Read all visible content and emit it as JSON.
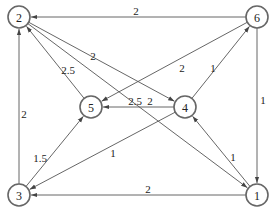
{
  "diagram": {
    "type": "directed-weighted-graph",
    "nodes": [
      {
        "id": "1",
        "label": "1",
        "x": 257,
        "y": 195
      },
      {
        "id": "2",
        "label": "2",
        "x": 19,
        "y": 17
      },
      {
        "id": "3",
        "label": "3",
        "x": 19,
        "y": 195
      },
      {
        "id": "4",
        "label": "4",
        "x": 185,
        "y": 107
      },
      {
        "id": "5",
        "label": "5",
        "x": 91,
        "y": 107
      },
      {
        "id": "6",
        "label": "6",
        "x": 257,
        "y": 17
      }
    ],
    "edges": [
      {
        "from": "6",
        "to": "2",
        "weight": "2",
        "lx": 136,
        "ly": 11
      },
      {
        "from": "6",
        "to": "1",
        "weight": "1",
        "lx": 263,
        "ly": 100
      },
      {
        "from": "1",
        "to": "3",
        "weight": "2",
        "lx": 148,
        "ly": 189
      },
      {
        "from": "3",
        "to": "2",
        "weight": "2",
        "lx": 24,
        "ly": 114
      },
      {
        "from": "3",
        "to": "5",
        "weight": "1.5",
        "lx": 40,
        "ly": 158
      },
      {
        "from": "5",
        "to": "2",
        "weight": "2.5",
        "lx": 68,
        "ly": 70
      },
      {
        "from": "2",
        "to": "4",
        "weight": "2",
        "lx": 93,
        "ly": 56
      },
      {
        "from": "2",
        "to": "1",
        "weight": "2.5",
        "lx": 135,
        "ly": 101
      },
      {
        "from": "4",
        "to": "5",
        "weight": "2",
        "lx": 150,
        "ly": 101
      },
      {
        "from": "6",
        "to": "5",
        "weight": "2",
        "lx": 182,
        "ly": 68
      },
      {
        "from": "4",
        "to": "6",
        "weight": "1",
        "lx": 213,
        "ly": 68
      },
      {
        "from": "1",
        "to": "4",
        "weight": "1",
        "lx": 233,
        "ly": 157
      },
      {
        "from": "4",
        "to": "3",
        "weight": "1",
        "lx": 113,
        "ly": 153
      }
    ]
  }
}
